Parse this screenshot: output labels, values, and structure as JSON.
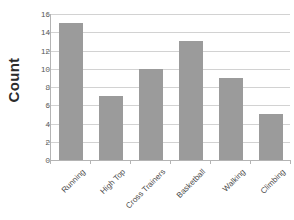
{
  "chart_data": {
    "type": "bar",
    "title": "",
    "subtitle": "",
    "xlabel": "",
    "ylabel": "Count",
    "categories": [
      "Running",
      "High Top",
      "Cross Trainers",
      "Basketball",
      "Walking",
      "Climbing"
    ],
    "values": [
      15,
      7,
      10,
      13,
      9,
      5
    ],
    "ylim": [
      0,
      16
    ],
    "ytick_step": 2,
    "yticks": [
      0,
      2,
      4,
      6,
      8,
      10,
      12,
      14,
      16
    ],
    "ytick_labels": [
      "0",
      "2",
      "4",
      "6",
      "8",
      "10",
      "12",
      "14",
      "16"
    ],
    "grid": true,
    "grid_axis": "y",
    "legend": false,
    "legend_position": "none",
    "bar_color": "#9b9b9b",
    "gridline_color": "#d2d2d2",
    "axis_color": "#b4b4b4",
    "background_color": "#ffffff",
    "xlabel_rotation": -45
  },
  "axis": {
    "y_title": "Count"
  }
}
